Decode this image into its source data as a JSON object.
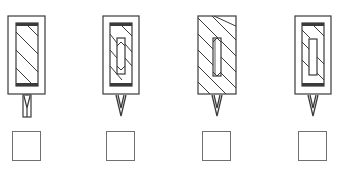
{
  "title": "",
  "colors": {
    "stroke": "#3a3a3a",
    "checkbox_border": "#707070",
    "background": "#ffffff"
  },
  "figures": [
    {
      "id": "A",
      "description": "outer frame, inner hatched core with thick end caps, split-leg pin below",
      "outer_frame": true,
      "inner_hatched_core": true,
      "center_slot": false,
      "lead_type": "split-pin"
    },
    {
      "id": "B",
      "description": "outer frame, inner hatched core, center slot with chevron hatching, tapered needle below",
      "outer_frame": true,
      "inner_hatched_core": true,
      "center_slot": true,
      "lead_type": "needle"
    },
    {
      "id": "C",
      "description": "fully hatched body without outer frame, center slot, tapered needle below",
      "outer_frame": false,
      "inner_hatched_core": true,
      "center_slot": true,
      "lead_type": "needle"
    },
    {
      "id": "D",
      "description": "outer frame, inner hatched core, plain center slot, tapered needle below",
      "outer_frame": true,
      "inner_hatched_core": true,
      "center_slot": true,
      "lead_type": "needle"
    }
  ],
  "answer_options": [
    {
      "id": "A",
      "checked": false
    },
    {
      "id": "B",
      "checked": false
    },
    {
      "id": "C",
      "checked": false
    },
    {
      "id": "D",
      "checked": false
    }
  ]
}
